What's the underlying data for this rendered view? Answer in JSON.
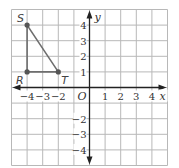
{
  "figure": {
    "type": "coordinate-plane",
    "x_axis_label": "x",
    "y_axis_label": "y",
    "origin_label": "O",
    "x_range": [
      -5,
      5
    ],
    "y_range": [
      -5,
      5
    ],
    "grid": true,
    "x_ticks": [
      {
        "value": -4,
        "label": "−4"
      },
      {
        "value": -3,
        "label": "−3"
      },
      {
        "value": -2,
        "label": "−2"
      },
      {
        "value": 1,
        "label": "1"
      },
      {
        "value": 2,
        "label": "2"
      },
      {
        "value": 3,
        "label": "3"
      },
      {
        "value": 4,
        "label": "4"
      }
    ],
    "y_ticks": [
      {
        "value": 4,
        "label": "4"
      },
      {
        "value": 3,
        "label": "3"
      },
      {
        "value": 2,
        "label": "2"
      },
      {
        "value": 1,
        "label": "1"
      },
      {
        "value": -2,
        "label": "−2"
      },
      {
        "value": -3,
        "label": "−3"
      },
      {
        "value": -4,
        "label": "−4"
      }
    ],
    "points": [
      {
        "name": "S",
        "x": -4,
        "y": 4
      },
      {
        "name": "R",
        "x": -4,
        "y": 1
      },
      {
        "name": "T",
        "x": -2,
        "y": 1
      }
    ],
    "polygon": [
      "S",
      "R",
      "T"
    ],
    "colors": {
      "grid": "#b8b8b8",
      "axis": "#222222",
      "triangle": "#6e6e6e",
      "point": "#555555"
    }
  }
}
